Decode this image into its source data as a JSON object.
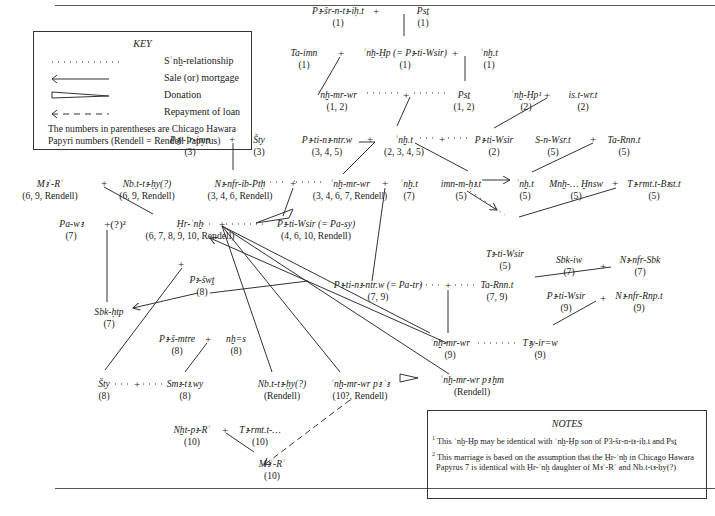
{
  "key": {
    "title": "KEY",
    "items": [
      {
        "symbol": "dotted-line",
        "label": "Sʿnḫ-relationship"
      },
      {
        "symbol": "solid-arrow-left",
        "label": "Sale (or) mortgage"
      },
      {
        "symbol": "wedge",
        "label": "Donation"
      },
      {
        "symbol": "dashed-arrow-left",
        "label": "Repayment of loan"
      }
    ],
    "note_line1": "The numbers in parentheses are Chicago Hawara",
    "note_line2": "Papyri numbers (Rendell = Rendell Papyrus)"
  },
  "notes": {
    "title": "NOTES",
    "items": [
      {
        "mark": "1",
        "text": "This ʿnḫ-Ḥp may be identical with ʿnḫ-Ḥp son of P3-šr-n-tꜣ-iḥ.t and Psṯ"
      },
      {
        "mark": "2",
        "text": "This marriage is based on the assumption that the Ḥr-ʿnḫ in Chicago Hawara Papyrus 7 is identical with Ḥr-ʿnḫ daughter of Mꜣʿ-Rʿ and Nb.t-tꜣ-ḥy(?)"
      }
    ]
  },
  "nodes": [
    {
      "id": "pashr",
      "name": "Pꜣ-šr-n-tꜣ-iḥ.t",
      "ref": "(1)",
      "x": 338,
      "y": 5
    },
    {
      "id": "pst1",
      "name": "Psṯ",
      "ref": "(1)",
      "x": 423,
      "y": 5
    },
    {
      "id": "taimn",
      "name": "Ta-imn",
      "ref": "(1)",
      "x": 304,
      "y": 47
    },
    {
      "id": "anhhp1",
      "name": "ʿnḫ-Ḥp (= Pꜣ-ti-Wsir)",
      "ref": "(1)",
      "x": 405,
      "y": 47
    },
    {
      "id": "anht1",
      "name": "ʿnḫ.t",
      "ref": "(1)",
      "x": 489,
      "y": 47
    },
    {
      "id": "anhmrwr12",
      "name": "ʿnḫ-mr-wr",
      "ref": "(1, 2)",
      "x": 337,
      "y": 89
    },
    {
      "id": "pst12",
      "name": "Psṯ",
      "ref": "(1, 2)",
      "x": 464,
      "y": 89
    },
    {
      "id": "anhhp2",
      "name": "ʿnḫ-Ḥp¹",
      "ref": "(2)",
      "x": 526,
      "y": 89
    },
    {
      "id": "isutwrt",
      "name": "is.t-wr.t",
      "ref": "(2)",
      "x": 583,
      "y": 89
    },
    {
      "id": "piyarimn",
      "name": "Pꜣy-ʿr-imn",
      "ref": "(3)",
      "x": 190,
      "y": 134
    },
    {
      "id": "sty3",
      "name": "Šty",
      "ref": "(3)",
      "x": 259,
      "y": 134
    },
    {
      "id": "patinintrw345",
      "name": "Pꜣ-ti-nꜣ-ntr.w",
      "ref": "(3, 4, 5)",
      "x": 327,
      "y": 134
    },
    {
      "id": "anht2345",
      "name": "ʿnḫ.t",
      "ref": "(2, 3, 4, 5)",
      "x": 404,
      "y": 134
    },
    {
      "id": "patiwsir2",
      "name": "Pꜣ-ti-Wsir",
      "ref": "(2)",
      "x": 494,
      "y": 134
    },
    {
      "id": "snwsrt",
      "name": "S-n-Wsr.t",
      "ref": "(5)",
      "x": 553,
      "y": 134
    },
    {
      "id": "tarnnt5",
      "name": "Ta-Rnn.t",
      "ref": "(5)",
      "x": 624,
      "y": 134
    },
    {
      "id": "mare1",
      "name": "Mꜣʿ-Rʿ",
      "ref": "(6, 9, Rendell)",
      "x": 50,
      "y": 178
    },
    {
      "id": "nbttahy1",
      "name": "Nb.t-tꜣ-ḥy(?)",
      "ref": "(6, 9, Rendell)",
      "x": 147,
      "y": 178
    },
    {
      "id": "nefribpth",
      "name": "Nꜣ-nfr-ib-Ptḥ",
      "ref": "(3, 4, 6, Rendell)",
      "x": 264,
      "y": 178
    },
    {
      "id": "anhmrwr3467",
      "name": "ʿnḫ-mr-wr",
      "ref": "(3, 4, 6, 7, Rendell)",
      "x": 354,
      "y": 178
    },
    {
      "id": "anht7",
      "name": "ʿnḫ.t",
      "ref": "(7)",
      "x": 409,
      "y": 178
    },
    {
      "id": "imnmhst",
      "name": "imn-m-ḥꜣ.t",
      "ref": "(5)",
      "x": 461,
      "y": 178
    },
    {
      "id": "anht5",
      "name": "ʿnḫ.t",
      "ref": "(5)",
      "x": 527,
      "y": 178
    },
    {
      "id": "mnhhnsw",
      "name": "Mnḫ-… Ḫnsw",
      "ref": "(5)",
      "x": 576,
      "y": 178
    },
    {
      "id": "tarmtbist",
      "name": "Tꜣ-rmt.t-Bꜣst.t",
      "ref": "(5)",
      "x": 654,
      "y": 178
    },
    {
      "id": "pawt",
      "name": "Pa-wꜣ",
      "ref": "(7)",
      "x": 71,
      "y": 220
    },
    {
      "id": "hranh",
      "name": "Ḥr-ʿnḫ",
      "ref": "(6, 7, 8, 9, 10, Rendell)",
      "x": 188,
      "y": 220
    },
    {
      "id": "patiwsirpasy",
      "name": "Pꜣ-ti-Wsir (= Pa-sy)",
      "ref": "(4, 6, 10, Rendell)",
      "x": 308,
      "y": 225
    },
    {
      "id": "tatiwsir5",
      "name": "Tꜣ-ti-Wsir",
      "ref": "(5)",
      "x": 505,
      "y": 225
    },
    {
      "id": "sbkiw",
      "name": "Sbk-iw",
      "ref": "(7)",
      "x": 569,
      "y": 258
    },
    {
      "id": "nefrsbk",
      "name": "Nꜣ-nfr-Sbk",
      "ref": "(7)",
      "x": 640,
      "y": 258
    },
    {
      "id": "pashwt",
      "name": "Pꜣ-šwṱ",
      "ref": "(8)",
      "x": 202,
      "y": 262
    },
    {
      "id": "patinintrwpatr",
      "name": "Pꜣ-ti-nꜣ-ntr.w (= Pa-tr)",
      "ref": "(7, 9)",
      "x": 378,
      "y": 281
    },
    {
      "id": "tarnnt79",
      "name": "Ta-Rnn.t",
      "ref": "(7, 9)",
      "x": 497,
      "y": 281
    },
    {
      "id": "sbkhtp",
      "name": "Sbk-ḥtp",
      "ref": "(7)",
      "x": 109,
      "y": 313
    },
    {
      "id": "patiwsir9",
      "name": "Pꜣ-ti-Wsir",
      "ref": "(9)",
      "x": 566,
      "y": 294
    },
    {
      "id": "nefrrnpt",
      "name": "Nꜣ-nfr-Rnp.t",
      "ref": "(9)",
      "x": 639,
      "y": 294
    },
    {
      "id": "pashmtre",
      "name": "Pꜣ-š-mtre",
      "ref": "(8)",
      "x": 177,
      "y": 334
    },
    {
      "id": "nhes",
      "name": "nḫ=s",
      "ref": "(8)",
      "x": 236,
      "y": 334
    },
    {
      "id": "anhmrwr9",
      "name": "ʿnḫ-mr-wr",
      "ref": "(9)",
      "x": 450,
      "y": 339
    },
    {
      "id": "tayirsw",
      "name": "Tꜣy-ir=w",
      "ref": "(9)",
      "x": 540,
      "y": 339
    },
    {
      "id": "sty8",
      "name": "Šty",
      "ref": "(8)",
      "x": 104,
      "y": 380
    },
    {
      "id": "smatawy",
      "name": "Smꜣ-tꜣ.wy",
      "ref": "(8)",
      "x": 185,
      "y": 380
    },
    {
      "id": "nbttahyr",
      "name": "Nb.t-tꜣ-ḥy(?)",
      "ref": "(Rendell)",
      "x": 282,
      "y": 380
    },
    {
      "id": "anhmrwrpa",
      "name": "ʿnḫ-mr-wr pꜣ ʿꜣ",
      "ref": "(10?, Rendell)",
      "x": 355,
      "y": 380
    },
    {
      "id": "anhmrwrhm",
      "name": "ʿnḫ-mr-wr pꜣ ḫm",
      "ref": "(Rendell)",
      "x": 472,
      "y": 380
    },
    {
      "id": "nhtpare",
      "name": "Nḫt-pꜣ-Rʿ",
      "ref": "(10)",
      "x": 192,
      "y": 425
    },
    {
      "id": "tarmtt",
      "name": "Tꜣ-rmt.t-…",
      "ref": "(10)",
      "x": 260,
      "y": 425
    },
    {
      "id": "mare10",
      "name": "Mꜣʿ-Rʿ",
      "ref": "(10)",
      "x": 260,
      "y": 460
    }
  ],
  "plus_signs": [
    {
      "x": 376,
      "y": 9,
      "label": "+"
    },
    {
      "x": 340,
      "y": 51,
      "label": "+"
    },
    {
      "x": 455,
      "y": 51,
      "label": "+"
    },
    {
      "x": 406,
      "y": 94,
      "label": "+"
    },
    {
      "x": 547,
      "y": 94,
      "label": "+"
    },
    {
      "x": 223,
      "y": 138,
      "label": "+"
    },
    {
      "x": 370,
      "y": 138,
      "label": "+"
    },
    {
      "x": 442,
      "y": 138,
      "label": "+"
    },
    {
      "x": 592,
      "y": 138,
      "label": "+"
    },
    {
      "x": 104,
      "y": 182,
      "label": "+"
    },
    {
      "x": 292,
      "y": 182,
      "label": "+"
    },
    {
      "x": 384,
      "y": 182,
      "label": "+"
    },
    {
      "x": 614,
      "y": 182,
      "label": "+"
    },
    {
      "x": 108,
      "y": 224,
      "label": "+(?)²"
    },
    {
      "x": 220,
      "y": 224,
      "label": "+"
    },
    {
      "x": 182,
      "y": 262,
      "label": "+"
    },
    {
      "x": 603,
      "y": 262,
      "label": "+"
    },
    {
      "x": 448,
      "y": 285,
      "label": "+"
    },
    {
      "x": 603,
      "y": 298,
      "label": "+"
    },
    {
      "x": 208,
      "y": 338,
      "label": "+"
    },
    {
      "x": 137,
      "y": 384,
      "label": "+"
    },
    {
      "x": 225,
      "y": 429,
      "label": "+"
    }
  ]
}
